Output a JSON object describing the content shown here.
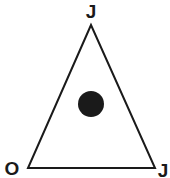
{
  "diagram": {
    "shape": "triangle",
    "vertices": {
      "top": {
        "label": "J"
      },
      "bottom_left": {
        "label": "O"
      },
      "bottom_right": {
        "label": "J"
      }
    },
    "marker": {
      "type": "filled-circle",
      "color": "#1a1a1a"
    },
    "line_color": "#1a1a1a"
  }
}
